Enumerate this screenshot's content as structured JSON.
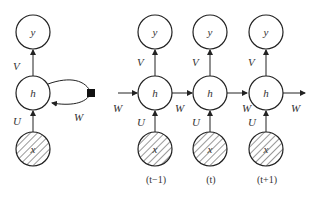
{
  "diagram": {
    "node_labels": {
      "output": "y",
      "hidden": "h",
      "input": "x"
    },
    "weight_labels": {
      "input_to_hidden": "U",
      "hidden_to_output": "V",
      "recurrent": "W"
    },
    "folded": {
      "nodes": [
        "y",
        "h",
        "x"
      ],
      "edges": [
        {
          "from": "x",
          "to": "h",
          "label": "U"
        },
        {
          "from": "h",
          "to": "y",
          "label": "V"
        },
        {
          "from": "h",
          "to": "h",
          "label": "W",
          "via": "delay-square"
        }
      ]
    },
    "unfolded": {
      "time_steps": [
        {
          "label": "(t−1)"
        },
        {
          "label": "(t)"
        },
        {
          "label": "(t+1)"
        }
      ],
      "incoming_label": "W",
      "between_labels": [
        "W",
        "W"
      ],
      "outgoing_label": "W"
    }
  }
}
